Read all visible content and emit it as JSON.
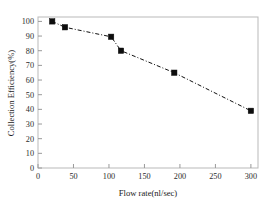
{
  "chart_data": {
    "type": "line",
    "title": "",
    "subtitle": "",
    "xlabel": "Flow rate(nl/sec)",
    "ylabel": "Collection Efficiency(%)",
    "xlim": [
      0,
      310
    ],
    "ylim": [
      0,
      103
    ],
    "xticks": [
      0,
      50,
      100,
      150,
      200,
      250,
      300
    ],
    "yticks": [
      0,
      10,
      20,
      30,
      40,
      50,
      60,
      70,
      80,
      90,
      100
    ],
    "xtick_labels": [
      "0",
      "50",
      "100",
      "150",
      "200",
      "250",
      "300"
    ],
    "ytick_labels": [
      "0",
      "10",
      "20",
      "30",
      "40",
      "50",
      "60",
      "70",
      "80",
      "90",
      "100"
    ],
    "grid": false,
    "legend": false,
    "legend_position": "none",
    "line_style": "dash-dot",
    "marker_style": "filled-square",
    "marker_color": "#0d0d0d",
    "line_color": "#111111",
    "frame_color": "#b9b9b9",
    "series": [
      {
        "name": "Collection Efficiency",
        "x": [
          20,
          38,
          103,
          117,
          192,
          300
        ],
        "values": [
          100,
          96,
          89.5,
          80,
          65,
          39
        ]
      }
    ]
  }
}
